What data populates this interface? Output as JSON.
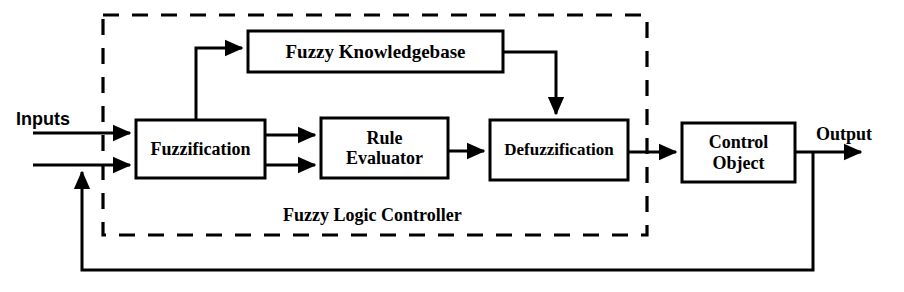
{
  "diagram": {
    "colors": {
      "stroke": "#000000",
      "background": "#ffffff",
      "text": "#000000"
    },
    "canvas": {
      "width": 904,
      "height": 292
    },
    "boundary": {
      "label": "Fuzzy Logic Controller",
      "style": "dashed",
      "x": 103,
      "y": 15,
      "width": 544,
      "height": 220,
      "label_x": 390,
      "label_y": 216,
      "label_font_size": 18
    },
    "blocks": [
      {
        "id": "fuzzy-knowledgebase",
        "label": "Fuzzy Knowledgebase",
        "x": 248,
        "y": 31,
        "width": 255,
        "height": 41,
        "font_size": 19
      },
      {
        "id": "fuzzification",
        "label": "Fuzzification",
        "x": 136,
        "y": 120,
        "width": 129,
        "height": 58,
        "font_size": 18
      },
      {
        "id": "rule-evaluator",
        "label": "Rule\nEvaluator",
        "x": 321,
        "y": 118,
        "width": 127,
        "height": 60,
        "font_size": 18
      },
      {
        "id": "defuzzification",
        "label": "Defuzzification",
        "x": 490,
        "y": 120,
        "width": 138,
        "height": 60,
        "font_size": 17
      },
      {
        "id": "control-object",
        "label": "Control\nObject",
        "x": 682,
        "y": 123,
        "width": 113,
        "height": 59,
        "font_size": 18
      }
    ],
    "free_labels": [
      {
        "id": "inputs-label",
        "text": "Inputs",
        "x": 16,
        "y": 109,
        "font_size": 18,
        "font": "sans"
      },
      {
        "id": "output-label",
        "text": "Output",
        "x": 816,
        "y": 124,
        "font_size": 18,
        "font": "serif"
      }
    ],
    "connections": [
      {
        "id": "input-1-to-fuzzification",
        "from": "Inputs",
        "to": "Fuzzification",
        "arrow": true
      },
      {
        "id": "input-2-to-fuzzification",
        "from": "Inputs",
        "to": "Fuzzification",
        "arrow": true
      },
      {
        "id": "fuzzification-to-knowledgebase",
        "from": "Fuzzification",
        "to": "Fuzzy Knowledgebase",
        "arrow": true
      },
      {
        "id": "fuzzification-to-rule-evaluator-upper",
        "from": "Fuzzification",
        "to": "Rule Evaluator",
        "arrow": true
      },
      {
        "id": "fuzzification-to-rule-evaluator-lower",
        "from": "Fuzzification",
        "to": "Rule Evaluator",
        "arrow": true
      },
      {
        "id": "rule-evaluator-to-defuzzification",
        "from": "Rule Evaluator",
        "to": "Defuzzification",
        "arrow": true
      },
      {
        "id": "knowledgebase-to-defuzzification",
        "from": "Fuzzy Knowledgebase",
        "to": "Defuzzification",
        "arrow": true
      },
      {
        "id": "defuzzification-to-control-object",
        "from": "Defuzzification",
        "to": "Control Object",
        "arrow": true
      },
      {
        "id": "control-object-to-output",
        "from": "Control Object",
        "to": "Output",
        "arrow": true
      },
      {
        "id": "feedback-to-fuzzification",
        "from": "Output",
        "to": "Fuzzification",
        "arrow": true
      }
    ]
  }
}
